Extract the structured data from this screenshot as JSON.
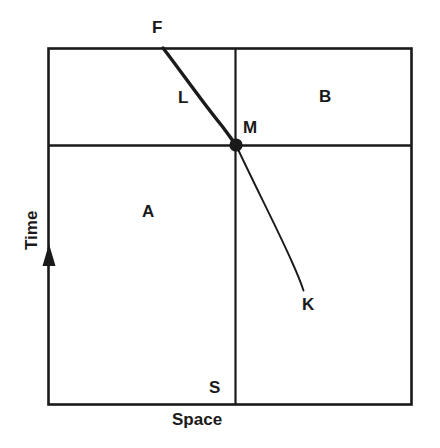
{
  "figure": {
    "title": "",
    "type": "space-time-diagram",
    "background_color": "#ffffff",
    "line_color": "#1a1a1a"
  },
  "axes": {
    "y": {
      "label": "Time",
      "direction_arrow": "up-arrow-icon"
    },
    "x": {
      "label": "Space"
    }
  },
  "regions": [
    {
      "key": "L",
      "label": "L"
    },
    {
      "key": "B",
      "label": "B"
    },
    {
      "key": "A",
      "label": "A"
    }
  ],
  "points": [
    {
      "key": "F",
      "label": "F"
    },
    {
      "key": "M",
      "label": "M",
      "marker": "filled-dot"
    },
    {
      "key": "K",
      "label": "K"
    },
    {
      "key": "S",
      "label": "S"
    }
  ],
  "curve": {
    "name": "trajectory-FMK",
    "from_label": "F",
    "through_label": "M",
    "to_label": "K"
  }
}
